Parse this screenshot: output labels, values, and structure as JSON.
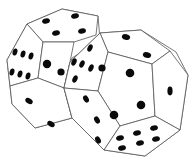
{
  "image": {
    "description": "Line illustration of two twelve-sided (dodecahedron) dice with black pips",
    "background": "#ffffff",
    "stroke_color": "#555555",
    "pip_color": "#0a0a0a"
  },
  "dice": [
    {
      "name": "back-die",
      "position": "left-rear",
      "visible_faces": [
        {
          "face": "top",
          "pips": 4
        },
        {
          "face": "left-upper",
          "pips": 6
        },
        {
          "face": "front-center",
          "pips": 2
        },
        {
          "face": "bottom-left",
          "pips": 2
        }
      ]
    },
    {
      "name": "front-die",
      "position": "right-front",
      "visible_faces": [
        {
          "face": "top",
          "pips": 2
        },
        {
          "face": "left-upper",
          "pips": 5
        },
        {
          "face": "center",
          "pips": 4
        },
        {
          "face": "right",
          "pips": 1
        },
        {
          "face": "lower-left",
          "pips": 3
        },
        {
          "face": "bottom",
          "pips": 6
        }
      ]
    }
  ]
}
